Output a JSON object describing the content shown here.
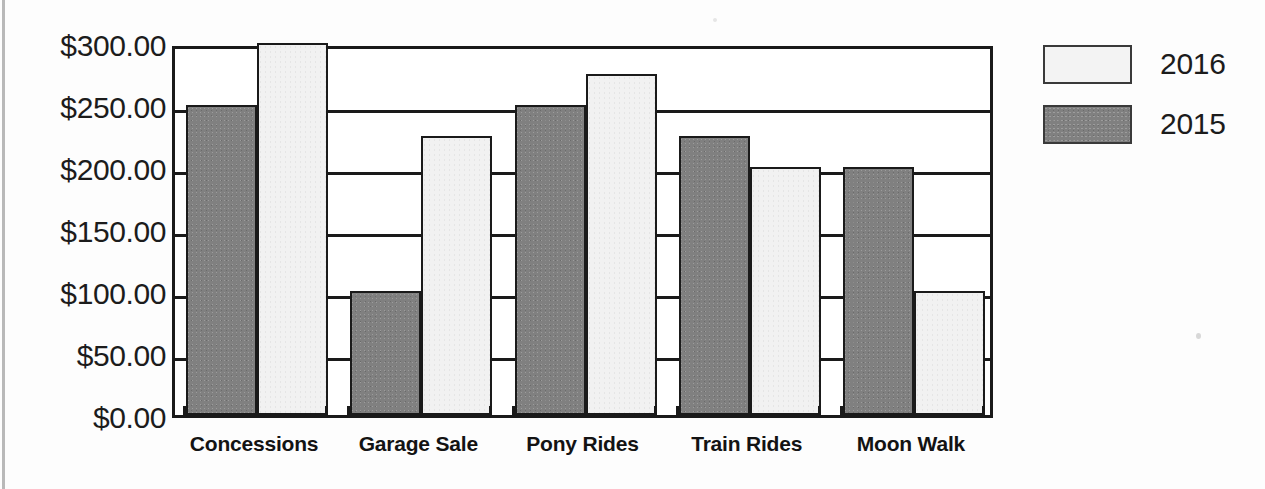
{
  "chart_data": {
    "type": "bar",
    "title": "",
    "xlabel": "",
    "ylabel": "",
    "categories": [
      "Concessions",
      "Garage Sale",
      "Pony Rides",
      "Train Rides",
      "Moon Walk"
    ],
    "series": [
      {
        "name": "2016",
        "color": "#f1f1f1",
        "values": [
          300,
          225,
          275,
          200,
          100
        ]
      },
      {
        "name": "2015",
        "color": "#808080",
        "values": [
          250,
          100,
          250,
          225,
          200
        ]
      }
    ],
    "series_plot_order": [
      "2015",
      "2016"
    ],
    "ylim": [
      0,
      300
    ],
    "ytick_step": 50,
    "ytick_labels": [
      "$300.00",
      "$250.00",
      "$200.00",
      "$150.00",
      "$100.00",
      "$50.00",
      "$0.00"
    ],
    "ytick_values": [
      300,
      250,
      200,
      150,
      100,
      50,
      0
    ],
    "grid": true,
    "grid_axis": "y",
    "legend_position": "right",
    "value_prefix": "$",
    "value_suffix": ".00"
  },
  "legend": {
    "items": [
      {
        "label": "2016",
        "swatch": "light"
      },
      {
        "label": "2015",
        "swatch": "dark"
      }
    ]
  },
  "axis": {
    "y_labels": [
      "$300.00",
      "$250.00",
      "$200.00",
      "$150.00",
      "$100.00",
      "$50.00",
      "$0.00"
    ],
    "x_labels": [
      "Concessions",
      "Garage Sale",
      "Pony Rides",
      "Train Rides",
      "Moon Walk"
    ]
  },
  "colors": {
    "series_2015": "#808080",
    "series_2016": "#f1f1f1",
    "axis": "#1a1a1a",
    "text": "#1c1c1c",
    "background": "#fdfdfd"
  },
  "title_fragment": ""
}
